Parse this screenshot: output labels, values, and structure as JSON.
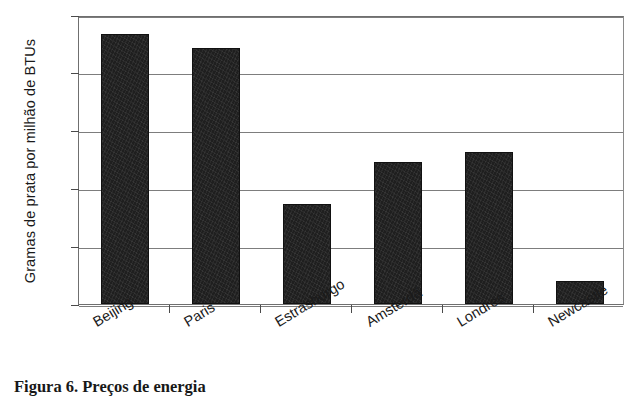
{
  "chart_data": {
    "type": "bar",
    "title": "",
    "xlabel": "",
    "ylabel": "Gramas de prata por milhão de BTUs",
    "categories": [
      "Beijing",
      "Paris",
      "Estrasburgo",
      "Amsterdã",
      "Londres",
      "Newcastle"
    ],
    "values": [
      9.35,
      8.85,
      3.45,
      4.9,
      5.25,
      0.8
    ],
    "series": [
      {
        "name": "Gramas de prata por milhão de BTUs",
        "values": [
          9.35,
          8.85,
          3.45,
          4.9,
          5.25,
          0.8
        ]
      }
    ],
    "ylim": [
      0,
      10
    ],
    "ytick_labels": [
      "0",
      "2",
      "4",
      "6",
      "8",
      "10"
    ],
    "ytick_values": [
      0,
      2,
      4,
      6,
      8,
      10
    ],
    "grid": true,
    "legend": false,
    "bar_color": "#1f1f1f",
    "axis_color": "#6f6f6f"
  },
  "caption": {
    "text": "Figura 6. Preços de energia"
  }
}
